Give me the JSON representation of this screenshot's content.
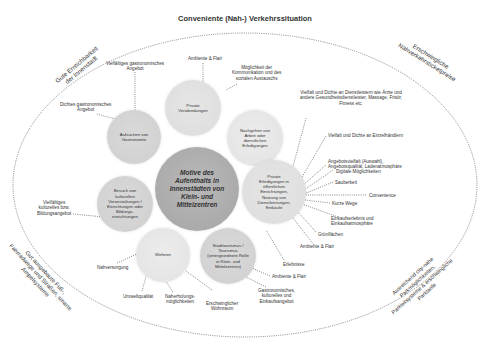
{
  "title": "Conveniente (Nah-) Verkehrssituation",
  "arc_labels": {
    "top_left": "Gute Erreichbarkeit\nder Innenstadt",
    "top_right": "Erschwingliche\nNahverkehrsticketpreise",
    "bottom_left": "Gut ausgebaute Fuß-,\nFahrradwege und Straßen, smarte\nAmpelsysteme",
    "bottom_right": "Ausreichend city-nahe\nParkmöglichkeiten,\nParkleitsysteme & erschwingliche\nParktarife"
  },
  "center": "Motive des\nAufenthalts in\nInnenstädten von\nKlein- und\nMittelzentren",
  "circles": {
    "gastronomie": "Aufsuchen von\nGastronomie",
    "private_verabredungen": "Private\nVerabredungen",
    "arbeit": "Nachgehen von\nArbeit oder\ndienstlichen\nErledigungen",
    "kultur": "Besuch von\nkulturellen\nVeranstaltungen /\nEinrichtungen oder\nBildungs-\neinrichtungen",
    "private_erledigungen": "Private\nErledigungen in\nöffentlichen\nEinrichtungen,\nNutzung von\nDienstleistungen,\nEinkäufe",
    "wohnen": "Wohnen",
    "stadttourismus": "Stadttourismus /\nTourismus\n(untergeordnete Rolle\nin Klein- und\nMittelzentren)"
  },
  "labels": {
    "ambiente_top": "Ambiente & Flair",
    "kommunikation": "Möglichkeit der\nKommunikation und des\nsozialen Austauschs",
    "vielfaeltiges_gastro": "Vielfältiges gastronomisches\nAngebot",
    "dichtes_gastro": "Dichtes gastronomisches\nAngebot",
    "vielfalt_dienstleister": "Vielfalt und Dichte an Dienstleistern wie Ärzte und\nandere Gesundheitsdienstleister, Massage, Frisör,\nFitness etc.",
    "vielfalt_einzelhaendler": "Vielfalt und Dichte an Einzelhändlern",
    "angebotsvielfalt": "Angebotsvielfalt (Auswahl),\nAngebotsqualität, Ladenatmosphäre",
    "digitale": "Digitale Möglichkeiten",
    "sauberkeit": "Sauberkeit",
    "convenience": "Convenience",
    "kurze_wege": "Kurze Wege",
    "einkaufserlebnis": "Einkaufserlebnis und\nEinkaufsatmosphäre",
    "gruenflaechen": "Grünflächen",
    "ambiente_right": "Ambiente & Flair",
    "erlebnisse": "Erlebnisse",
    "ambiente_bottom": "Ambiente & Flair",
    "gastro_kultur": "Gastronomisches,\nkulturelles und\nEinkaufsangebot",
    "kulturelles_angebot": "Vielfältiges\nkulturelles bzw.\nBildungsangebot",
    "nahversorgung": "Nahversorgung",
    "umweltqualitaet": "Umweltqualität",
    "naherholung": "Naherholungs-\nmöglichkeiten",
    "wohnraum": "Erschwinglicher\nWohnraum"
  }
}
